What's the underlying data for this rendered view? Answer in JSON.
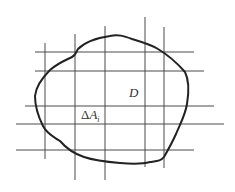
{
  "diagram": {
    "type": "region-partition",
    "colors": {
      "background": "#ffffff",
      "grid": "#4a4a4a",
      "boundary": "#222222",
      "text": "#333333"
    },
    "labels": {
      "region": "D",
      "cell_delta": "Δ",
      "cell_var": "A",
      "cell_subscript": "i"
    },
    "label_positions": {
      "region": {
        "x": 129,
        "y": 97
      },
      "cell": {
        "x": 81,
        "y": 119
      }
    },
    "horizontal_lines": [
      {
        "y": 52,
        "x1": 35,
        "x2": 194
      },
      {
        "y": 71,
        "x1": 35,
        "x2": 204
      },
      {
        "y": 106,
        "x1": 25,
        "x2": 214
      },
      {
        "y": 124,
        "x1": 16,
        "x2": 224
      },
      {
        "y": 150,
        "x1": 16,
        "x2": 194
      }
    ],
    "vertical_lines": [
      {
        "x": 45,
        "y1": 43,
        "y2": 159
      },
      {
        "x": 75,
        "y1": 34,
        "y2": 180
      },
      {
        "x": 105,
        "y1": 26,
        "y2": 180
      },
      {
        "x": 145,
        "y1": 17,
        "y2": 167
      },
      {
        "x": 164,
        "y1": 27,
        "y2": 168
      }
    ],
    "boundary_path": "M 110,36 C 118,34 124,36 132,39 C 142,42 152,45 158,49 C 168,55 178,64 185,72 C 189,80 189,92 187,104 C 185,116 180,124 176,134 C 172,143 168,150 164,157 C 161,161 157,161 150,162 C 143,164 132,164 120,163 C 108,162 96,161 84,157 C 72,153 66,148 60,141 C 54,137 47,134 43,126 C 38,116 35,106 35,96 C 36,86 42,78 50,70 C 58,63 66,60 72,57 C 76,55 76,52 78,49 C 84,43 96,38 110,36 Z"
  }
}
